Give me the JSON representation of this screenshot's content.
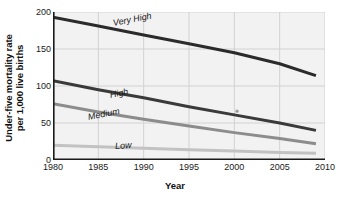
{
  "chart_data": {
    "type": "line",
    "title": "",
    "xlabel": "Year",
    "ylabel": "Under-five mortality rate per 1,000 live births",
    "ylabel_lines": [
      "Under-five mortality rate",
      "per 1,000 live births"
    ],
    "x": [
      1980,
      1985,
      1990,
      1995,
      2000,
      2005,
      2009
    ],
    "xlim": [
      1980,
      2010
    ],
    "ylim": [
      0,
      200
    ],
    "xticks": [
      1980,
      1985,
      1990,
      1995,
      2000,
      2005,
      2010
    ],
    "yticks": [
      0,
      50,
      100,
      150,
      200
    ],
    "xtick_labels": [
      "1980",
      "1985",
      "1990",
      "1995",
      "2000",
      "2005",
      "2010"
    ],
    "ytick_labels": [
      "0",
      "50",
      "100",
      "150",
      "200"
    ],
    "grid": true,
    "legend": "inline-labels",
    "series": [
      {
        "name": "Very High",
        "color": "#2b2b2b",
        "values": [
          193,
          181,
          169,
          157,
          145,
          130,
          114
        ]
      },
      {
        "name": "High",
        "color": "#3a3a3a",
        "values": [
          107,
          95,
          84,
          72,
          61,
          50,
          40
        ]
      },
      {
        "name": "Medium",
        "color": "#8c8c8c",
        "values": [
          76,
          65,
          55,
          46,
          37,
          29,
          22
        ]
      },
      {
        "name": "Low",
        "color": "#c2c2c2",
        "values": [
          20,
          18,
          16,
          14,
          12,
          10,
          9
        ]
      }
    ],
    "annotations": [
      {
        "name": "stray-dot",
        "x": 2000.3,
        "y": 66,
        "color": "#9a9a9a"
      }
    ]
  },
  "style": {
    "plot_background": "#f2f2f2",
    "grid_color": "#d2d2d2",
    "axis_color": "#1a1a1a",
    "page_background": "#ffffff"
  },
  "series_label_positions": [
    {
      "label": "Very High",
      "left": 60,
      "top": 6,
      "rotate": -11
    },
    {
      "label": "High",
      "left": 57,
      "top": 78,
      "rotate": -12
    },
    {
      "label": "Medium",
      "left": 35,
      "top": 100,
      "rotate": -11
    },
    {
      "label": "Low",
      "left": 62,
      "top": 129,
      "rotate": -4
    }
  ]
}
